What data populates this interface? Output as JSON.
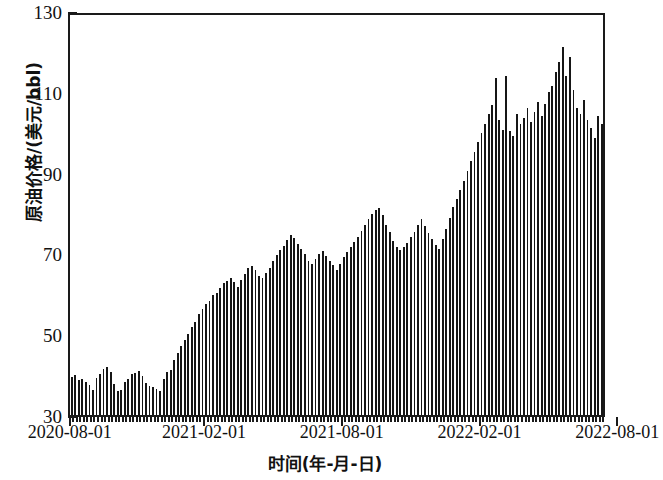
{
  "chart_data": {
    "type": "bar",
    "title": "",
    "xlabel": "时间(年-月-日)",
    "ylabel": "原油价格/(美元/bbl)",
    "ylim": [
      30,
      130
    ],
    "ytick_labels": [
      "30",
      "50",
      "70",
      "90",
      "110",
      "130"
    ],
    "ytick_values": [
      30,
      50,
      70,
      90,
      110,
      130
    ],
    "yminor_values": [
      40,
      60,
      80,
      100,
      120
    ],
    "xtick_labels": [
      "2020-08-01",
      "2021-02-01",
      "2021-08-01",
      "2022-02-01",
      "2022-08-01"
    ],
    "xtick_values": [
      "2020-08-01",
      "2021-02-01",
      "2021-08-01",
      "2022-02-01",
      "2022-08-01"
    ],
    "grid": false,
    "legend": null,
    "bar_color": "#161616",
    "series": [
      {
        "name": "原油价格",
        "values": [
          39.5,
          40.0,
          38.6,
          38.9,
          38.1,
          37.4,
          36.1,
          39.2,
          40.2,
          41.5,
          41.8,
          40.6,
          37.6,
          36.0,
          36.3,
          38.1,
          39.0,
          40.2,
          40.4,
          41.0,
          39.6,
          38.0,
          37.2,
          37.0,
          36.4,
          36.0,
          38.9,
          40.7,
          41.2,
          43.5,
          45.4,
          47.0,
          48.5,
          50.0,
          51.8,
          53.0,
          54.9,
          56.2,
          57.4,
          58.3,
          59.7,
          60.3,
          61.5,
          62.8,
          63.2,
          64.0,
          62.9,
          61.8,
          63.5,
          65.0,
          66.4,
          67.0,
          65.8,
          64.5,
          63.8,
          65.2,
          66.5,
          68.0,
          69.5,
          70.8,
          71.8,
          73.2,
          74.5,
          73.8,
          72.4,
          71.0,
          69.8,
          68.2,
          67.4,
          68.5,
          69.8,
          70.6,
          69.3,
          68.0,
          67.2,
          66.0,
          67.5,
          69.0,
          70.4,
          71.5,
          72.8,
          74.0,
          75.6,
          77.0,
          78.4,
          79.8,
          80.8,
          81.2,
          79.4,
          77.0,
          75.2,
          73.0,
          71.5,
          70.8,
          71.6,
          72.5,
          74.0,
          75.4,
          77.0,
          78.5,
          76.8,
          75.0,
          73.5,
          72.0,
          71.2,
          73.5,
          76.0,
          78.8,
          81.4,
          83.5,
          85.8,
          88.0,
          90.5,
          92.8,
          95.0,
          97.5,
          99.8,
          102.0,
          104.5,
          106.8,
          113.5,
          103.0,
          100.5,
          113.8,
          100.2,
          99.0,
          104.5,
          102.0,
          103.5,
          106.0,
          102.5,
          105.0,
          107.5,
          104.0,
          107.0,
          110.0,
          111.5,
          115.0,
          117.5,
          121.0,
          114.0,
          118.5,
          110.5,
          106.0,
          104.5,
          108.0,
          103.0,
          101.0,
          98.5,
          104.0,
          102.0,
          98.0
        ]
      }
    ],
    "bar_count": 158,
    "n_points": 158,
    "value_min": 36.0,
    "value_max": 121.0
  },
  "axes": {
    "y_axis_name": "y-axis",
    "x_axis_name": "x-axis"
  }
}
